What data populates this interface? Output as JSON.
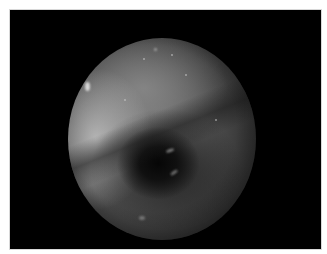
{
  "image": {
    "type": "endoscopic-view",
    "color_mode": "grayscale",
    "frame_color": "#000000",
    "border_color": "#ffffff",
    "field_of_view": "circular",
    "features": [
      "dark central lumen",
      "bright specular highlights",
      "mucosal surface"
    ]
  }
}
